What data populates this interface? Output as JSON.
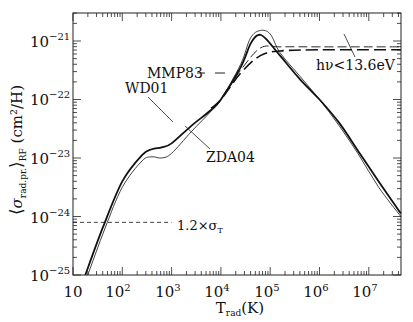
{
  "chart_data": {
    "type": "line",
    "title": "",
    "xlabel": "T_rad(K)",
    "ylabel": "<σ_rad.pr.>_RF (cm²/H)",
    "xscale": "log",
    "yscale": "log",
    "xlim": [
      10,
      45000000
    ],
    "ylim": [
      1e-25,
      3e-21
    ],
    "x_ticks": [
      "10",
      "10^2",
      "10^3",
      "10^4",
      "10^5",
      "10^6",
      "10^7"
    ],
    "y_ticks": [
      "10^-25",
      "10^-24",
      "10^-23",
      "10^-22",
      "10^-21"
    ],
    "grid": false,
    "series": [
      {
        "name": "WD01",
        "style": "thick solid",
        "log_x": [
          1.25,
          1.6,
          2.0,
          2.4,
          2.6,
          2.8,
          3.0,
          3.4,
          3.8,
          4.0,
          4.4,
          4.6,
          4.75,
          4.9,
          5.2,
          5.6,
          6.0,
          6.4,
          6.8,
          7.2,
          7.65
        ],
        "log_y": [
          -25.0,
          -24.2,
          -23.4,
          -22.95,
          -22.85,
          -22.82,
          -22.75,
          -22.45,
          -22.18,
          -22.0,
          -21.45,
          -21.05,
          -20.9,
          -20.95,
          -21.25,
          -21.65,
          -22.0,
          -22.4,
          -22.9,
          -23.4,
          -23.95
        ]
      },
      {
        "name": "ZDA04",
        "style": "thin solid",
        "log_x": [
          1.3,
          1.65,
          2.0,
          2.4,
          2.6,
          2.8,
          3.0,
          3.4,
          3.8,
          4.0,
          4.4,
          4.6,
          4.8,
          5.0,
          5.2,
          5.6,
          6.0,
          6.4,
          6.8,
          7.2,
          7.65
        ],
        "log_y": [
          -25.0,
          -24.2,
          -23.5,
          -23.05,
          -22.98,
          -23.0,
          -22.92,
          -22.55,
          -22.2,
          -22.0,
          -21.4,
          -20.95,
          -20.82,
          -20.88,
          -21.2,
          -21.6,
          -22.0,
          -22.45,
          -22.95,
          -23.5,
          -24.0
        ]
      },
      {
        "name": "MMP83",
        "style": "thin dashed",
        "log_x": [
          3.8,
          4.0,
          4.4,
          4.8,
          5.2,
          6.0,
          7.0,
          7.65
        ],
        "log_y": [
          -22.15,
          -22.0,
          -21.5,
          -21.12,
          -21.1,
          -21.1,
          -21.1,
          -21.1
        ]
      },
      {
        "name": "hν<13.6eV",
        "style": "thick dashed",
        "log_x": [
          3.8,
          4.0,
          4.4,
          4.8,
          5.2,
          6.0,
          7.0,
          7.65
        ],
        "log_y": [
          -22.15,
          -22.0,
          -21.55,
          -21.25,
          -21.17,
          -21.15,
          -21.15,
          -21.15
        ]
      },
      {
        "name": "1.2×σ_T",
        "style": "thin dashed horizontal",
        "log_x": [
          1.0,
          3.0
        ],
        "log_y": [
          -24.1,
          -24.1
        ]
      }
    ],
    "annotations": [
      {
        "text": "WD01",
        "arrow_to": "WD01 curve near T≈2×10^3"
      },
      {
        "text": "ZDA04",
        "arrow_to": "ZDA04 curve near T≈3×10^3"
      },
      {
        "text": "MMP83",
        "marker": "dashed line segment"
      },
      {
        "text": "hν<13.6eV",
        "arrow_to": "dashed line near T≈2×10^6"
      },
      {
        "text": "1.2×σ_T",
        "marker": "horizontal dashed line"
      }
    ]
  },
  "labels": {
    "x_axis": "T",
    "x_axis_sub": "rad",
    "x_axis_unit": "(K)",
    "y_axis_sym": "σ",
    "y_axis_sub": "rad.pr.",
    "y_axis_sub2": "RF",
    "y_axis_unit": "(cm²/H)",
    "wd01": "WD01",
    "zda04": "ZDA04",
    "mmp83": "MMP83",
    "hnu": "hν<13.6eV",
    "sigmaT_pre": "1.2×σ",
    "sigmaT_sub": "T"
  },
  "ticks": {
    "x": [
      {
        "base": "10",
        "exp": ""
      },
      {
        "base": "10",
        "exp": "2"
      },
      {
        "base": "10",
        "exp": "3"
      },
      {
        "base": "10",
        "exp": "4"
      },
      {
        "base": "10",
        "exp": "5"
      },
      {
        "base": "10",
        "exp": "6"
      },
      {
        "base": "10",
        "exp": "7"
      }
    ],
    "y": [
      {
        "base": "10",
        "exp": "−21"
      },
      {
        "base": "10",
        "exp": "−22"
      },
      {
        "base": "10",
        "exp": "−23"
      },
      {
        "base": "10",
        "exp": "−24"
      },
      {
        "base": "10",
        "exp": "−25"
      }
    ]
  }
}
